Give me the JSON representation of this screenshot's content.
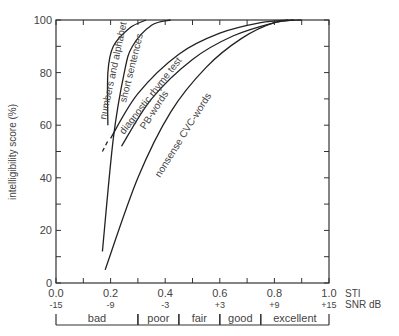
{
  "chart_data": {
    "type": "line",
    "title": "",
    "xlabel": "STI",
    "xlabel2": "SNR dB",
    "ylabel": "intelligibility score (%)",
    "xlim": [
      0.0,
      1.0
    ],
    "ylim": [
      0,
      100
    ],
    "grid": false,
    "x_ticks": [
      "0.0",
      "0.2",
      "0.4",
      "0.6",
      "0.8",
      "1.0"
    ],
    "x_ticks_snr": [
      "-15",
      "-9",
      "-3",
      "+3",
      "+9",
      "+15"
    ],
    "y_ticks": [
      "0",
      "20",
      "40",
      "60",
      "80",
      "100"
    ],
    "quality_bands": [
      {
        "label": "bad",
        "from": 0.0,
        "to": 0.3
      },
      {
        "label": "poor",
        "from": 0.3,
        "to": 0.45
      },
      {
        "label": "fair",
        "from": 0.45,
        "to": 0.6
      },
      {
        "label": "good",
        "from": 0.6,
        "to": 0.75
      },
      {
        "label": "excellent",
        "from": 0.75,
        "to": 1.0
      }
    ],
    "series": [
      {
        "name": "numbers and alphabet",
        "points": [
          [
            0.19,
            60
          ],
          [
            0.19,
            80
          ],
          [
            0.21,
            90
          ],
          [
            0.27,
            97
          ],
          [
            0.33,
            100
          ]
        ]
      },
      {
        "name": "short sentences",
        "points": [
          [
            0.17,
            12
          ],
          [
            0.21,
            55
          ],
          [
            0.25,
            80
          ],
          [
            0.28,
            90
          ],
          [
            0.35,
            98
          ],
          [
            0.42,
            100
          ]
        ]
      },
      {
        "name": "diagnostic rhyme test",
        "points": [
          [
            0.2,
            55
          ],
          [
            0.3,
            72
          ],
          [
            0.45,
            87
          ],
          [
            0.6,
            95
          ],
          [
            0.75,
            99
          ],
          [
            0.85,
            100
          ]
        ],
        "dashed_start": [
          [
            0.17,
            50
          ],
          [
            0.19,
            54
          ]
        ]
      },
      {
        "name": "PB-words",
        "points": [
          [
            0.24,
            52
          ],
          [
            0.35,
            70
          ],
          [
            0.5,
            85
          ],
          [
            0.65,
            94
          ],
          [
            0.8,
            99
          ],
          [
            0.87,
            100
          ]
        ]
      },
      {
        "name": "nonsense CVC-words",
        "points": [
          [
            0.18,
            5
          ],
          [
            0.3,
            40
          ],
          [
            0.42,
            65
          ],
          [
            0.55,
            82
          ],
          [
            0.68,
            93
          ],
          [
            0.8,
            99
          ],
          [
            0.9,
            100
          ]
        ]
      }
    ]
  },
  "labels": {
    "ylabel": "intelligibility score (%)",
    "sti": "STI",
    "snr": "SNR dB",
    "numbers": "numbers and alphabet",
    "sentences": "short sentences",
    "drt": "diagnostic rhyme test",
    "pb": "PB-words",
    "cvc": "nonsense CVC-words"
  }
}
